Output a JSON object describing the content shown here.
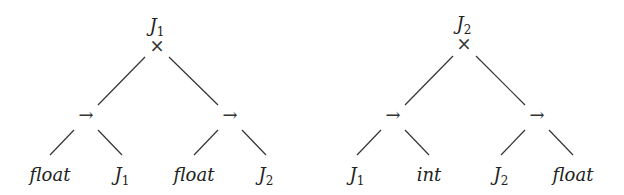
{
  "diagram": {
    "type": "tree",
    "colors": {
      "line": "#333333",
      "text": "#222222",
      "background": "#ffffff"
    },
    "trees": [
      {
        "root": {
          "name": "J",
          "subscript": "1",
          "operator": "×"
        },
        "children": [
          {
            "operator": "→",
            "leaves": [
              {
                "name": "float",
                "subscript": ""
              },
              {
                "name": "J",
                "subscript": "1"
              }
            ]
          },
          {
            "operator": "→",
            "leaves": [
              {
                "name": "float",
                "subscript": ""
              },
              {
                "name": "J",
                "subscript": "2"
              }
            ]
          }
        ]
      },
      {
        "root": {
          "name": "J",
          "subscript": "2",
          "operator": "×"
        },
        "children": [
          {
            "operator": "→",
            "leaves": [
              {
                "name": "J",
                "subscript": "1"
              },
              {
                "name": "int",
                "subscript": ""
              }
            ]
          },
          {
            "operator": "→",
            "leaves": [
              {
                "name": "J",
                "subscript": "2"
              },
              {
                "name": "float",
                "subscript": ""
              }
            ]
          }
        ]
      }
    ]
  }
}
